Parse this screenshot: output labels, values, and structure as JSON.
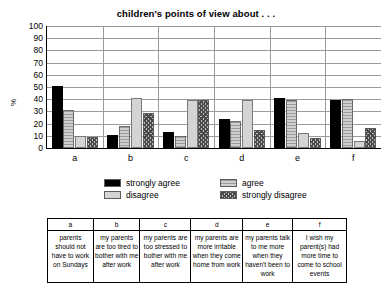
{
  "chart_data": {
    "type": "bar",
    "title": "children's points of view about . . .",
    "xlabel": "",
    "ylabel": "%",
    "ylim": [
      0,
      100
    ],
    "yticks": [
      0,
      10,
      20,
      30,
      40,
      50,
      60,
      70,
      80,
      90,
      100
    ],
    "grid": true,
    "legend_position": "bottom",
    "categories": [
      "a",
      "b",
      "c",
      "d",
      "e",
      "f"
    ],
    "series": [
      {
        "name": "strongly agree",
        "values": [
          51,
          11,
          13,
          24,
          41,
          39
        ]
      },
      {
        "name": "agree",
        "values": [
          31,
          18,
          10,
          22,
          39,
          40
        ]
      },
      {
        "name": "disagree",
        "values": [
          10,
          41,
          39,
          39,
          12,
          6
        ]
      },
      {
        "name": "strongly disagree",
        "values": [
          9,
          29,
          39,
          15,
          8,
          16
        ]
      }
    ],
    "colors": {
      "strongly_agree": "#000000",
      "agree": "#b6b6b6",
      "disagree": "#d4d4d4",
      "strongly_disagree": "#8f8f8f"
    }
  },
  "legend": {
    "items": [
      {
        "label": "strongly agree",
        "swatch": "black-swatch"
      },
      {
        "label": "agree",
        "swatch": "hatched-gray-swatch"
      },
      {
        "label": "disagree",
        "swatch": "light-gray-swatch"
      },
      {
        "label": "strongly disagree",
        "swatch": "checkered-swatch"
      }
    ]
  },
  "table": {
    "headers": [
      "a",
      "b",
      "c",
      "d",
      "e",
      "f"
    ],
    "descriptions": [
      "parents should not have to work on Sundays",
      "my parents are too tired to bother with me after work",
      "my parents are too stressed to bother with me after work",
      "my parents are more irritable when they come home from work",
      "my parents talk to me more when they haven't been to work",
      "I wish my parent(s) had more time to come to school events"
    ]
  }
}
